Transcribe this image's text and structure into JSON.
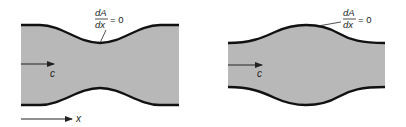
{
  "diagram": {
    "colors": {
      "fill": "#b8b8b8",
      "wall": "#111111",
      "text": "#222222"
    },
    "left_panel": {
      "shape": "converging-diverging duct (throat)",
      "velocity_label": "c",
      "condition": {
        "numerator": "dA",
        "denominator": "dx",
        "rhs": "= 0"
      }
    },
    "right_panel": {
      "shape": "diverging-converging duct (bulge)",
      "velocity_label": "c",
      "condition": {
        "numerator": "dA",
        "denominator": "dx",
        "rhs": "= 0"
      }
    },
    "axis": {
      "label": "x"
    }
  }
}
